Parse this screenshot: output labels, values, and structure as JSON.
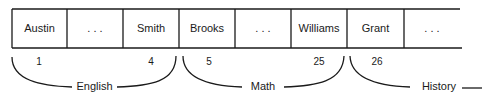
{
  "cells": [
    {
      "label": "Austin"
    },
    {
      "label": ".  .  ."
    },
    {
      "label": "Smith"
    },
    {
      "label": "Brooks"
    },
    {
      "label": ".  .  ."
    },
    {
      "label": "Williams"
    },
    {
      "label": "Grant"
    },
    {
      "label": ".  .  ."
    }
  ],
  "groups": [
    {
      "label": "English",
      "start_index": "1",
      "end_index": "4"
    },
    {
      "label": "Math",
      "start_index": "5",
      "end_index": "25"
    },
    {
      "label": "History",
      "start_index": "26",
      "end_index": ""
    }
  ]
}
